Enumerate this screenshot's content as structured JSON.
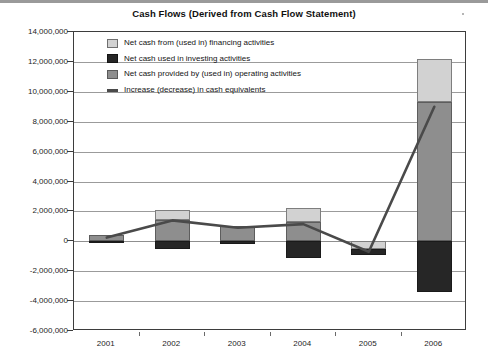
{
  "chart_data": {
    "type": "bar",
    "title": "Cash Flows (Derived from Cash Flow Statement)",
    "xlabel": "",
    "ylabel": "",
    "categories": [
      "2001",
      "2002",
      "2003",
      "2004",
      "2005",
      "2006"
    ],
    "ylim": [
      -6000000,
      14000000
    ],
    "ytick_step": 2000000,
    "ytick_labels": [
      "14,000,000",
      "12,000,000",
      "10,000,000",
      "8,000,000",
      "6,000,000",
      "4,000,000",
      "2,000,000",
      "0",
      "-2,000,000",
      "-4,000,000",
      "-6,000,000"
    ],
    "ytick_values": [
      14000000,
      12000000,
      10000000,
      8000000,
      6000000,
      4000000,
      2000000,
      0,
      -2000000,
      -4000000,
      -6000000
    ],
    "grid": true,
    "stacked": true,
    "legend_position": "inside-top-left",
    "series": [
      {
        "name": "Net cash from (used in) financing activities",
        "color": "#d2d2d2",
        "values": [
          0,
          700000,
          0,
          900000,
          -500000,
          2900000
        ]
      },
      {
        "name": "Net cash used in investing activities",
        "color": "#262626",
        "values": [
          -100000,
          -500000,
          -200000,
          -1100000,
          -400000,
          -3400000
        ]
      },
      {
        "name": "Net cash provided by (used in) operating activities",
        "color": "#8e8e8e",
        "values": [
          450000,
          1400000,
          1000000,
          1300000,
          0,
          9300000
        ]
      },
      {
        "name": "Increase (decrease) in cash equivalents",
        "color": "#4a4a4a",
        "type": "line",
        "values": [
          250000,
          1400000,
          900000,
          1150000,
          -700000,
          9000000
        ]
      }
    ],
    "legend": [
      {
        "label": "Net cash from (used in) financing activities",
        "swatch": "fin",
        "color": "#d2d2d2"
      },
      {
        "label": "Net cash used in investing activities",
        "swatch": "inv",
        "color": "#262626"
      },
      {
        "label": "Net cash provided by (used in) operating activities",
        "swatch": "ops",
        "color": "#8e8e8e"
      },
      {
        "label": "Increase (decrease) in cash equivalents",
        "swatch": "line",
        "color": "#4a4a4a"
      }
    ]
  }
}
